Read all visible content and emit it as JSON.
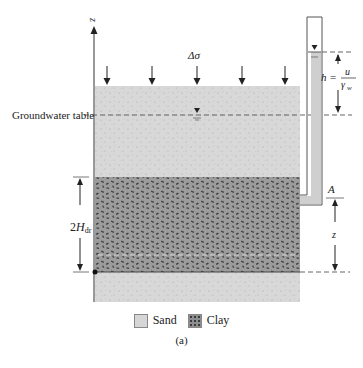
{
  "figure": {
    "caption": "(a)",
    "labels": {
      "z_axis": "z",
      "stress_increment": "Δσ",
      "groundwater_table": "Groundwater table",
      "drainage_thickness": "2H",
      "drainage_thickness_sub": "dr",
      "point_A": "A",
      "depth_z": "z",
      "head_h": "h =",
      "head_numerator": "u",
      "head_denominator": "γ",
      "head_denominator_sub": "w"
    },
    "legend": [
      {
        "label": "Sand",
        "pattern": "sand"
      },
      {
        "label": "Clay",
        "pattern": "clay"
      }
    ],
    "layers": [
      {
        "name": "Sand (top)",
        "color": "#d6d6d6"
      },
      {
        "name": "Clay",
        "color": "#8e8e8e"
      },
      {
        "name": "Sand (bottom)",
        "color": "#d6d6d6"
      }
    ],
    "load_arrow_count": 5
  }
}
